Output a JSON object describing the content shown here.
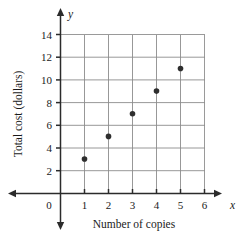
{
  "chart_data": {
    "type": "scatter",
    "title": "",
    "xlabel": "Number of copies",
    "ylabel": "Total cost (dollars)",
    "x_axis_variable": "x",
    "y_axis_variable": "y",
    "xlim": [
      0,
      6
    ],
    "ylim": [
      0,
      14
    ],
    "x_ticks": [
      0,
      1,
      2,
      3,
      4,
      5,
      6
    ],
    "y_ticks": [
      2,
      4,
      6,
      8,
      10,
      12,
      14
    ],
    "x_tick_labels": [
      "0",
      "1",
      "2",
      "3",
      "4",
      "5",
      "6"
    ],
    "y_tick_labels": [
      "2",
      "4",
      "6",
      "8",
      "10",
      "12",
      "14"
    ],
    "grid": true,
    "legend": false,
    "point_color": "#2e2e2e",
    "grid_color": "#8c8c8c",
    "axis_color": "#2b2b2b",
    "points": [
      {
        "x": 1,
        "y": 3
      },
      {
        "x": 2,
        "y": 5
      },
      {
        "x": 3,
        "y": 7
      },
      {
        "x": 4,
        "y": 9
      },
      {
        "x": 5,
        "y": 11
      }
    ],
    "series": [
      {
        "name": "Total cost",
        "x": [
          1,
          2,
          3,
          4,
          5
        ],
        "values": [
          3,
          5,
          7,
          9,
          11
        ]
      }
    ]
  }
}
